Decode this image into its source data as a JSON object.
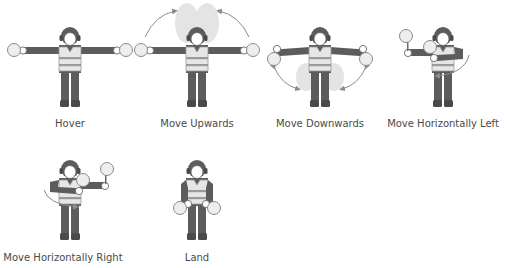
{
  "figure": {
    "colors": {
      "body": "#5c5c5c",
      "vest": "#e6e6e6",
      "vest_stripe": "#9a9a9a",
      "face": "#ffffff",
      "paddle": "#eeeeee",
      "paddle_outline": "#8a8a8a",
      "arrow": "#8c8c8c",
      "ghost": "#e4e4e4",
      "label": "#4a4a4a"
    },
    "signals": [
      {
        "id": "hover",
        "label": "Hover"
      },
      {
        "id": "move-upwards",
        "label": "Move Upwards"
      },
      {
        "id": "move-downwards",
        "label": "Move Downwards"
      },
      {
        "id": "move-horizontally-left",
        "label": "Move Horizontally Left"
      },
      {
        "id": "move-horizontally-right",
        "label": "Move Horizontally Right"
      },
      {
        "id": "land",
        "label": "Land"
      }
    ]
  }
}
